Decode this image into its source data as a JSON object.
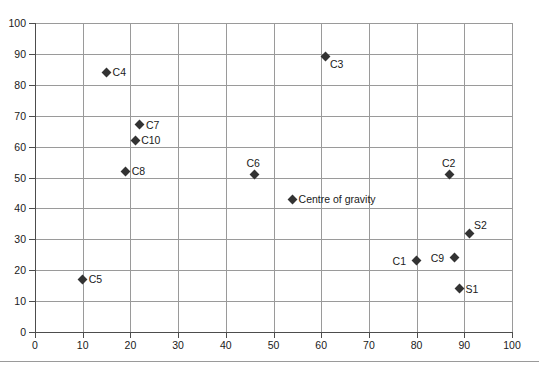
{
  "chart_data": {
    "type": "scatter",
    "title": "",
    "subtitle": "",
    "xlabel": "",
    "ylabel": "",
    "xlim": [
      0,
      100
    ],
    "ylim": [
      0,
      100
    ],
    "xticks": [
      0,
      10,
      20,
      30,
      40,
      50,
      60,
      70,
      80,
      90,
      100
    ],
    "yticks": [
      0,
      10,
      20,
      30,
      40,
      50,
      60,
      70,
      80,
      90,
      100
    ],
    "grid": true,
    "legend": "none",
    "marker_shape": "diamond",
    "marker_color": "#333333",
    "grid_color": "#9a9a9a",
    "axis_color": "#4d4d4d",
    "points": [
      {
        "label": "C4",
        "x": 15,
        "y": 84,
        "label_pos": "right"
      },
      {
        "label": "C7",
        "x": 22,
        "y": 67,
        "label_pos": "right"
      },
      {
        "label": "C10",
        "x": 21,
        "y": 62,
        "label_pos": "right"
      },
      {
        "label": "C8",
        "x": 19,
        "y": 52,
        "label_pos": "right"
      },
      {
        "label": "C5",
        "x": 10,
        "y": 17,
        "label_pos": "right"
      },
      {
        "label": "C6",
        "x": 46,
        "y": 51,
        "label_pos": "above"
      },
      {
        "label": "Centre of gravity",
        "x": 54,
        "y": 43,
        "label_pos": "right"
      },
      {
        "label": "C3",
        "x": 61,
        "y": 89,
        "label_pos": "below-right"
      },
      {
        "label": "C2",
        "x": 87,
        "y": 51,
        "label_pos": "above"
      },
      {
        "label": "S2",
        "x": 91,
        "y": 32,
        "label_pos": "above-right"
      },
      {
        "label": "C9",
        "x": 88,
        "y": 24,
        "label_pos": "left"
      },
      {
        "label": "C1",
        "x": 80,
        "y": 23,
        "label_pos": "left"
      },
      {
        "label": "S1",
        "x": 89,
        "y": 14,
        "label_pos": "right"
      }
    ]
  }
}
